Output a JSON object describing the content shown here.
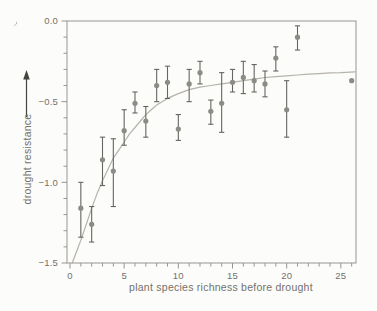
{
  "chart_data": {
    "type": "scatter",
    "title": "",
    "xlabel": "plant species richness before drought",
    "ylabel": "drought resistance",
    "xlim": [
      0,
      26.4
    ],
    "ylim": [
      -1.5,
      0.0
    ],
    "grid": false,
    "legend": null,
    "x_ticks": {
      "major": [
        0,
        5,
        10,
        15,
        20,
        25
      ],
      "labels": [
        "0",
        "5",
        "10",
        "15",
        "20",
        "25"
      ],
      "minor_step": 1,
      "minor_range": [
        1,
        26
      ]
    },
    "y_ticks": {
      "major": [
        0.0,
        -0.5,
        -1.0,
        -1.5
      ],
      "labels": [
        "0.0",
        "−0.5",
        "−1.0",
        "−1.5"
      ],
      "minor_step": 0.1
    },
    "points": [
      {
        "x": 1,
        "y": -1.16,
        "lo": -1.34,
        "hi": -1.0
      },
      {
        "x": 2,
        "y": -1.26,
        "lo": -1.37,
        "hi": -1.15
      },
      {
        "x": 3,
        "y": -0.86,
        "lo": -1.02,
        "hi": -0.72
      },
      {
        "x": 4,
        "y": -0.93,
        "lo": -1.15,
        "hi": -0.73
      },
      {
        "x": 5,
        "y": -0.68,
        "lo": -0.77,
        "hi": -0.55
      },
      {
        "x": 6,
        "y": -0.51,
        "lo": -0.57,
        "hi": -0.44
      },
      {
        "x": 7,
        "y": -0.62,
        "lo": -0.72,
        "hi": -0.53
      },
      {
        "x": 8,
        "y": -0.4,
        "lo": -0.5,
        "hi": -0.3
      },
      {
        "x": 9,
        "y": -0.38,
        "lo": -0.48,
        "hi": -0.28
      },
      {
        "x": 10,
        "y": -0.67,
        "lo": -0.74,
        "hi": -0.58
      },
      {
        "x": 11,
        "y": -0.39,
        "lo": -0.5,
        "hi": -0.3
      },
      {
        "x": 12,
        "y": -0.32,
        "lo": -0.39,
        "hi": -0.25
      },
      {
        "x": 13,
        "y": -0.56,
        "lo": -0.64,
        "hi": -0.49
      },
      {
        "x": 14,
        "y": -0.51,
        "lo": -0.69,
        "hi": -0.32
      },
      {
        "x": 15,
        "y": -0.38,
        "lo": -0.44,
        "hi": -0.3
      },
      {
        "x": 16,
        "y": -0.35,
        "lo": -0.45,
        "hi": -0.25
      },
      {
        "x": 17,
        "y": -0.37,
        "lo": -0.44,
        "hi": -0.27
      },
      {
        "x": 18,
        "y": -0.39,
        "lo": -0.47,
        "hi": -0.31
      },
      {
        "x": 19,
        "y": -0.23,
        "lo": -0.31,
        "hi": -0.16
      },
      {
        "x": 20,
        "y": -0.55,
        "lo": -0.72,
        "hi": -0.37
      },
      {
        "x": 21,
        "y": -0.1,
        "lo": -0.18,
        "hi": -0.03
      },
      {
        "x": 26,
        "y": -0.37,
        "lo": null,
        "hi": null
      }
    ],
    "fit_curve": [
      [
        0.2,
        -1.5
      ],
      [
        0.6,
        -1.43
      ],
      [
        1.0,
        -1.36
      ],
      [
        1.5,
        -1.26
      ],
      [
        2.0,
        -1.16
      ],
      [
        2.5,
        -1.07
      ],
      [
        3.0,
        -0.99
      ],
      [
        3.5,
        -0.92
      ],
      [
        4.0,
        -0.85
      ],
      [
        4.5,
        -0.8
      ],
      [
        5.0,
        -0.75
      ],
      [
        5.5,
        -0.7
      ],
      [
        6.0,
        -0.66
      ],
      [
        6.5,
        -0.62
      ],
      [
        7.0,
        -0.58
      ],
      [
        7.5,
        -0.55
      ],
      [
        8.0,
        -0.52
      ],
      [
        9.0,
        -0.48
      ],
      [
        10.0,
        -0.45
      ],
      [
        11.0,
        -0.425
      ],
      [
        12.0,
        -0.41
      ],
      [
        13.0,
        -0.4
      ],
      [
        14.0,
        -0.39
      ],
      [
        15.0,
        -0.38
      ],
      [
        16.0,
        -0.37
      ],
      [
        17.0,
        -0.36
      ],
      [
        18.0,
        -0.35
      ],
      [
        19.0,
        -0.345
      ],
      [
        20.0,
        -0.34
      ],
      [
        21.0,
        -0.335
      ],
      [
        22.0,
        -0.33
      ],
      [
        23.0,
        -0.326
      ],
      [
        24.0,
        -0.322
      ],
      [
        25.0,
        -0.32
      ],
      [
        26.3,
        -0.315
      ]
    ],
    "colors": {
      "background": "#fcfcfa",
      "axis": "#97958f",
      "tick_text": "#73716c",
      "point": "#8d8b86",
      "error_bar": "#67655f",
      "curve": "#b5b2ab",
      "arrow": "#45433e"
    }
  }
}
